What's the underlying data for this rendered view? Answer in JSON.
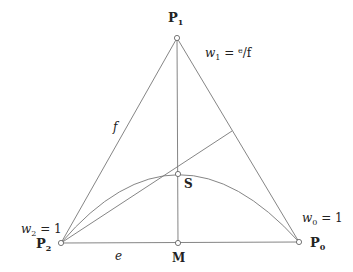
{
  "diagram": {
    "points": {
      "P0": {
        "label": "P",
        "sub": "0",
        "x": 299,
        "y": 242
      },
      "P1": {
        "label": "P",
        "sub": "1",
        "x": 177,
        "y": 38
      },
      "P2": {
        "label": "P",
        "sub": "2",
        "x": 61,
        "y": 243
      },
      "S": {
        "label": "S",
        "x": 178,
        "y": 174
      },
      "M": {
        "label": "M",
        "x": 178,
        "y": 243
      }
    },
    "weights": {
      "w0": {
        "var": "w",
        "sub": "0",
        "eq": " = 1"
      },
      "w1": {
        "var": "w",
        "sub": "1",
        "eq": " = ",
        "num": "e",
        "den": "f"
      },
      "w2": {
        "var": "w",
        "sub": "2",
        "eq": " = 1"
      }
    },
    "segment_labels": {
      "e": "e",
      "f": "f"
    },
    "colors": {
      "line": "#666666",
      "text": "#222222",
      "background": "#ffffff"
    }
  }
}
